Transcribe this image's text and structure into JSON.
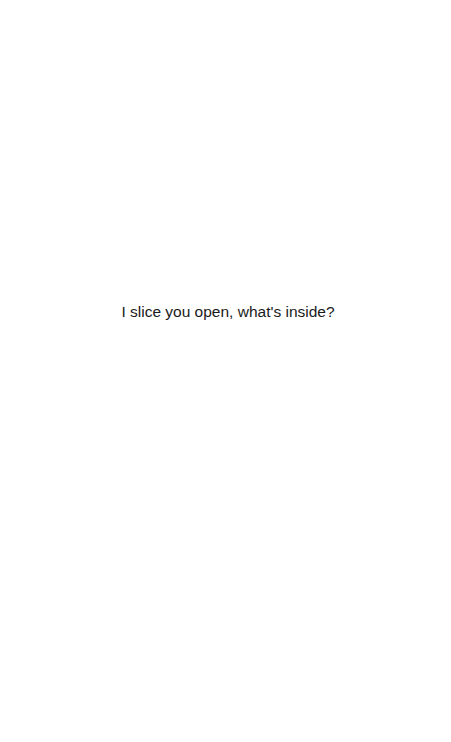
{
  "page": {
    "background": "#ffffff",
    "caption": "I slice you open, what's inside?",
    "text_color": "#1a1a1a"
  }
}
